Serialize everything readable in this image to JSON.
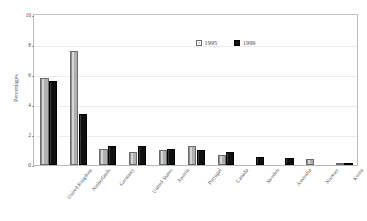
{
  "chart_data": {
    "type": "bar",
    "title": "",
    "subtitle": "",
    "xlabel": "",
    "ylabel": "Percentages",
    "ylim": [
      0,
      10
    ],
    "yticks": [
      0,
      2,
      4,
      6,
      8,
      10
    ],
    "ytick_labels": [
      "0",
      "2",
      "4",
      "6",
      "8",
      "10"
    ],
    "grid": true,
    "legend_position": "inside-top-center",
    "categories": [
      "United Kingdom",
      "Netherlands",
      "Germany",
      "United States",
      "Austria",
      "Portugal",
      "Canada",
      "Sweden",
      "Australia",
      "Norway",
      "Korea"
    ],
    "series": [
      {
        "name": "1995",
        "color": "#b0b0b0",
        "values": [
          5.8,
          7.6,
          1.1,
          0.85,
          1.0,
          1.3,
          0.7,
          0.0,
          0.0,
          0.4,
          0.05
        ]
      },
      {
        "name": "1999",
        "color": "#111111",
        "values": [
          5.6,
          3.4,
          1.3,
          1.25,
          1.05,
          1.0,
          0.85,
          0.55,
          0.45,
          0.0,
          0.08
        ]
      }
    ]
  },
  "legend": {
    "entries": [
      {
        "label": "1995",
        "swatch": "light-gray-square"
      },
      {
        "label": "1999",
        "swatch": "black-square"
      }
    ]
  },
  "axes": {
    "y_title": "Percentages",
    "y_tick_labels": [
      "10",
      "8",
      "6",
      "4",
      "2",
      "0"
    ]
  }
}
